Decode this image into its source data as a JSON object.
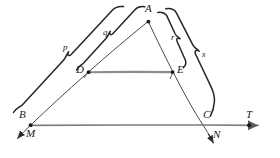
{
  "figure": {
    "background": "#ffffff",
    "ink_color": "#262626",
    "ray_color": "#6e6e6e",
    "segment_color": "#8a8a8a",
    "width": 280,
    "height": 158,
    "points": [
      {
        "id": "B",
        "label": "B",
        "x": 30,
        "y": 125,
        "label_x": 20,
        "label_y": 112,
        "dot": true
      },
      {
        "id": "M",
        "label": "M",
        "x": 22,
        "y": 133,
        "label_x": 26,
        "label_y": 133,
        "dot": false
      },
      {
        "id": "A",
        "label": "A",
        "x": 148,
        "y": 21,
        "label_x": 146,
        "label_y": 6,
        "dot": true
      },
      {
        "id": "D",
        "label": "D",
        "x": 88,
        "y": 72,
        "label_x": 77,
        "label_y": 68,
        "dot": true
      },
      {
        "id": "E",
        "label": "E",
        "x": 173,
        "y": 72,
        "label_x": 177,
        "label_y": 68,
        "dot": true
      },
      {
        "id": "C",
        "label": "C",
        "x": 203,
        "y": 125,
        "label_x": 204,
        "label_y": 112,
        "dot": false
      },
      {
        "id": "N",
        "label": "N",
        "x": 212,
        "y": 143,
        "label_x": 212,
        "label_y": 132,
        "dot": false
      },
      {
        "id": "T",
        "label": "T",
        "x": 249,
        "y": 125,
        "label_x": 247,
        "label_y": 112,
        "dot": true
      }
    ],
    "braces": [
      {
        "id": "p",
        "label": "p",
        "from": "B",
        "to": "A",
        "side": "left",
        "label_x": 64,
        "label_y": 48
      },
      {
        "id": "q",
        "label": "q",
        "from": "D",
        "to": "A",
        "side": "left",
        "label_x": 104,
        "label_y": 33
      },
      {
        "id": "r",
        "label": "r",
        "from": "A",
        "to": "E",
        "side": "right",
        "label_x": 172,
        "label_y": 38
      },
      {
        "id": "x",
        "label": "x",
        "from": "A",
        "to": "C",
        "side": "right",
        "label_x": 203,
        "label_y": 56
      }
    ],
    "segments": [
      {
        "id": "BA",
        "label": "side B to A"
      },
      {
        "id": "AC",
        "label": "side A to C"
      },
      {
        "id": "DE",
        "label": "segment D to E"
      },
      {
        "id": "MN",
        "label": "line M through B and C to N"
      },
      {
        "id": "BT",
        "label": "base line B to T"
      }
    ]
  }
}
